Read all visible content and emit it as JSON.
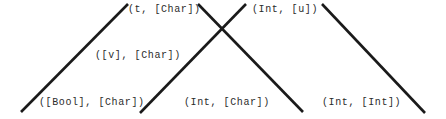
{
  "diagram": {
    "background_color": "#ffffff",
    "edge_color": "#1a1a1a",
    "edge_width": 2.6,
    "text_color": "#2b2b2b",
    "width": 446,
    "height": 119,
    "nodes": [
      {
        "id": "n-t-char",
        "label": "(t, [Char])",
        "x": 128,
        "y": 4,
        "level": "top"
      },
      {
        "id": "n-int-u",
        "label": "(Int, [u])",
        "x": 252,
        "y": 4,
        "level": "top"
      },
      {
        "id": "n-v-char",
        "label": "([v], [Char])",
        "x": 95,
        "y": 50,
        "level": "middle"
      },
      {
        "id": "n-bool-char",
        "label": "([Bool], [Char])",
        "x": 39,
        "y": 97,
        "level": "bottom"
      },
      {
        "id": "n-int-char",
        "label": "(Int, [Char])",
        "x": 184,
        "y": 97,
        "level": "bottom"
      },
      {
        "id": "n-int-int",
        "label": "(Int, [Int])",
        "x": 322,
        "y": 97,
        "level": "bottom"
      }
    ],
    "edges": [
      {
        "id": "edge-left-rising",
        "x1": 21,
        "y1": 112,
        "x2": 128,
        "y2": 4,
        "direction": "rising"
      },
      {
        "id": "edge-mid-rising",
        "x1": 140,
        "y1": 113,
        "x2": 246,
        "y2": 4,
        "direction": "rising"
      },
      {
        "id": "edge-mid-falling",
        "x1": 198,
        "y1": 4,
        "x2": 303,
        "y2": 112,
        "direction": "falling"
      },
      {
        "id": "edge-right-falling",
        "x1": 322,
        "y1": 4,
        "x2": 425,
        "y2": 113,
        "direction": "falling"
      }
    ]
  }
}
